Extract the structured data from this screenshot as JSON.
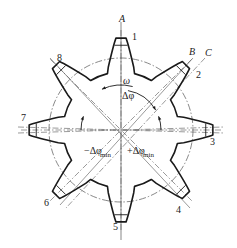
{
  "diagram": {
    "title": "",
    "center": [
      121,
      130
    ],
    "tip_radius": 92,
    "root_radius": 58,
    "pitch_circle_radius": 72,
    "teeth": [
      {
        "label": "1",
        "angle_deg": -90,
        "pos": [
          132,
          40
        ]
      },
      {
        "label": "2",
        "angle_deg": -45,
        "pos": [
          196,
          78
        ]
      },
      {
        "label": "3",
        "angle_deg": 0,
        "pos": [
          210,
          145
        ]
      },
      {
        "label": "4",
        "angle_deg": 45,
        "pos": [
          176,
          213
        ]
      },
      {
        "label": "5",
        "angle_deg": 90,
        "pos": [
          113,
          230
        ]
      },
      {
        "label": "6",
        "angle_deg": 135,
        "pos": [
          44,
          206
        ]
      },
      {
        "label": "7",
        "angle_deg": 180,
        "pos": [
          21,
          121
        ]
      },
      {
        "label": "8",
        "angle_deg": -135,
        "pos": [
          57,
          61
        ]
      }
    ],
    "axis_labels": {
      "A": "A",
      "B": "B",
      "C": "C"
    },
    "annotations": {
      "omega": "ω",
      "delta_phi": "Δφ",
      "minus_delta_phi_min": "−Δφ",
      "plus_delta_phi_min": "+Δφ",
      "min_subscript": "min"
    },
    "colors": {
      "stroke": "#1a1a1a",
      "centerline": "#555555",
      "background": "#ffffff"
    }
  }
}
